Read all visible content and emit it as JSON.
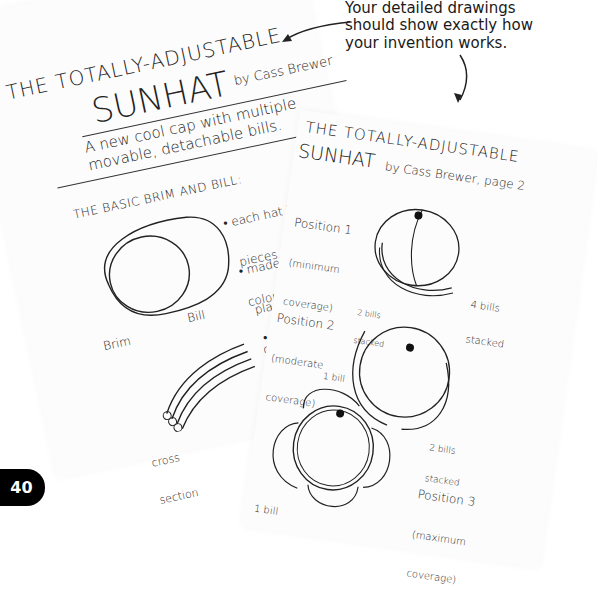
{
  "caption": {
    "line1": "Your detailed drawings",
    "line2": "should show exactly how",
    "line3": "your invention works."
  },
  "page_number": "40",
  "left_sheet": {
    "title_line1": "THE TOTALLY-ADJUSTABLE",
    "title_line2": "SUNHAT",
    "byline": "by Cass Brewer",
    "subtitle_line1": "A new cool cap with multiple",
    "subtitle_line2": "movable, detachable bills.",
    "section_heading": "THE BASIC BRIM AND BILL:",
    "bullets": [
      [
        "each hat has 4 of these",
        "pieces, all in different",
        "colors."
      ],
      [
        "made of transparent",
        "plastic, so the colors look",
        "cool when they overlap."
      ],
      [
        "brims interlock so they",
        "rotate on \"tracks.\" Only",
        "the bottom brim is",
        "fixed and others can",
        "be removed."
      ]
    ],
    "labels": {
      "brim": "Brim",
      "bill": "Bill",
      "cross_section_1": "cross",
      "cross_section_2": "section"
    }
  },
  "right_sheet": {
    "title_line1": "THE TOTALLY-ADJUSTABLE",
    "title_line2": "SUNHAT",
    "byline": "by Cass Brewer, page 2",
    "positions": [
      {
        "name": "Position 1",
        "detail_1": "(minimum",
        "detail_2": "coverage)",
        "note_1": "4 bills",
        "note_2": "stacked"
      },
      {
        "name": "Position 2",
        "detail_1": "(moderate",
        "detail_2": "coverage)",
        "note_1": "2 bills",
        "note_2": "stacked",
        "note_3": "2 bills",
        "note_4": "stacked"
      },
      {
        "name": "Position 3",
        "detail_1": "(maximum",
        "detail_2": "coverage)",
        "note_1": "1 bill",
        "note_2": "1 bill"
      }
    ]
  }
}
